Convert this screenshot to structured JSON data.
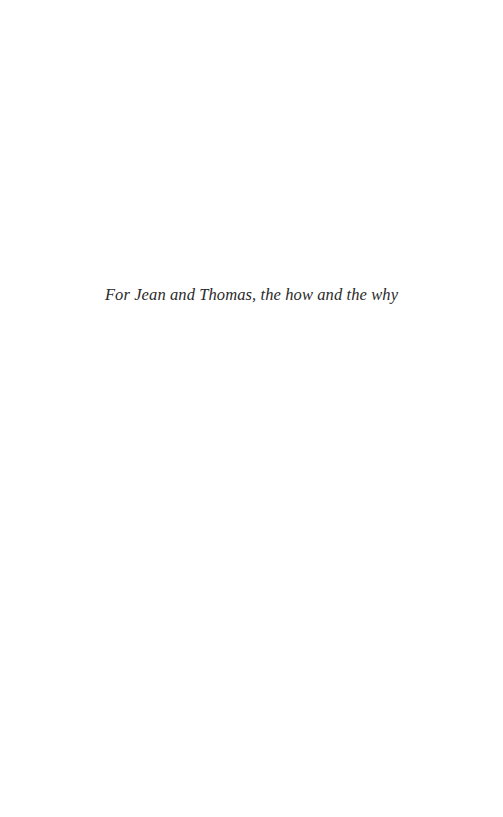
{
  "page": {
    "dedication": "For Jean and Thomas, the how and the why"
  },
  "colors": {
    "background": "#ffffff",
    "text": "#2a2a2a"
  }
}
